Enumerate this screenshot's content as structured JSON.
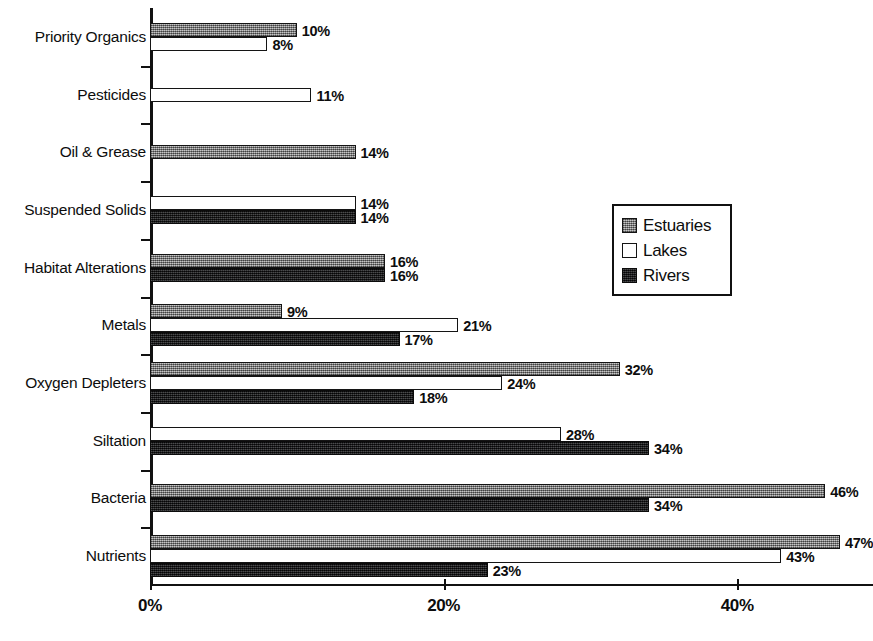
{
  "chart_data": {
    "type": "bar",
    "orientation": "horizontal",
    "title": "",
    "subtitle": "",
    "xlabel": "",
    "ylabel": "",
    "xlim": [
      0,
      50
    ],
    "xticks": [
      "0%",
      "20%",
      "40%"
    ],
    "xtick_values": [
      0,
      20,
      40
    ],
    "grid": false,
    "legend_position": "middle-right",
    "value_label_suffix": "%",
    "categories": [
      "Priority Organics",
      "Pesticides",
      "Oil & Grease",
      "Suspended Solids",
      "Habitat Alterations",
      "Metals",
      "Oxygen Depleters",
      "Siltation",
      "Bacteria",
      "Nutrients"
    ],
    "series": [
      {
        "name": "Estuaries",
        "color": "#8f8f8f",
        "pattern": "gray-dither",
        "values": [
          10,
          null,
          14,
          null,
          16,
          9,
          32,
          null,
          46,
          47
        ],
        "labels": [
          "10%",
          null,
          "14%",
          null,
          "16%",
          "9%",
          "32%",
          null,
          "46%",
          "47%"
        ]
      },
      {
        "name": "Lakes",
        "color": "#ffffff",
        "pattern": "outline",
        "values": [
          8,
          11,
          null,
          14,
          null,
          21,
          24,
          28,
          null,
          43
        ],
        "labels": [
          "8%",
          "11%",
          null,
          "14%",
          null,
          "21%",
          "24%",
          "28%",
          null,
          "43%"
        ]
      },
      {
        "name": "Rivers",
        "color": "#17181a",
        "pattern": "black-dither",
        "values": [
          null,
          null,
          null,
          14,
          16,
          17,
          18,
          34,
          34,
          23
        ],
        "labels": [
          null,
          null,
          null,
          "14%",
          "16%",
          "17%",
          "18%",
          "34%",
          "34%",
          "23%"
        ]
      }
    ]
  },
  "legend": {
    "items": [
      {
        "label": "Estuaries",
        "swatch": "estuaries"
      },
      {
        "label": "Lakes",
        "swatch": "lakes"
      },
      {
        "label": "Rivers",
        "swatch": "rivers"
      }
    ]
  }
}
